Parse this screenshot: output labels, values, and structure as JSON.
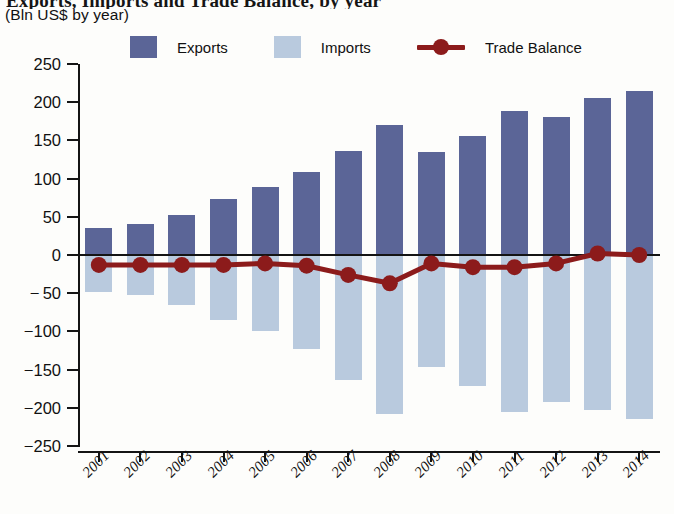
{
  "header": {
    "title": "Exports, Imports and Trade Balance, by year",
    "subtitle": "(Bln US$ by year)"
  },
  "legend": {
    "items": [
      {
        "label": "Exports",
        "type": "swatch",
        "color": "#5b6597"
      },
      {
        "label": "Imports",
        "type": "swatch",
        "color": "#b9cade"
      },
      {
        "label": "Trade Balance",
        "type": "line",
        "color": "#8c1b1b"
      }
    ]
  },
  "chart_data": {
    "type": "bar",
    "title": "Exports, Imports and Trade Balance, by year",
    "subtitle": "(Bln US$ by year)",
    "xlabel": "",
    "ylabel": "Bln US$ by year",
    "ylim": [
      -250,
      250
    ],
    "yticks": [
      250,
      200,
      150,
      100,
      50,
      0,
      -50,
      -100,
      -150,
      -200,
      -250
    ],
    "ytick_labels": [
      "250",
      "200",
      "150",
      "100",
      "50",
      "0",
      "− 50",
      "−100",
      "−150",
      "−200",
      "−250"
    ],
    "grid": false,
    "legend_position": "top",
    "categories": [
      "2001",
      "2002",
      "2003",
      "2004",
      "2005",
      "2006",
      "2007",
      "2008",
      "2009",
      "2010",
      "2011",
      "2012",
      "2013",
      "2014"
    ],
    "series": [
      {
        "name": "Exports",
        "type": "bar",
        "color": "#5b6597",
        "values": [
          35,
          40,
          52,
          73,
          89,
          109,
          136,
          170,
          135,
          156,
          189,
          181,
          205,
          215
        ]
      },
      {
        "name": "Imports",
        "type": "bar",
        "color": "#b9cade",
        "values": [
          -48,
          -52,
          -65,
          -85,
          -100,
          -123,
          -163,
          -208,
          -147,
          -172,
          -205,
          -192,
          -203,
          -215
        ]
      },
      {
        "name": "Trade Balance",
        "type": "line",
        "color": "#8c1b1b",
        "values": [
          -13,
          -13,
          -13,
          -13,
          -11,
          -14,
          -26,
          -37,
          -11,
          -16,
          -16,
          -11,
          2,
          0
        ]
      }
    ]
  }
}
